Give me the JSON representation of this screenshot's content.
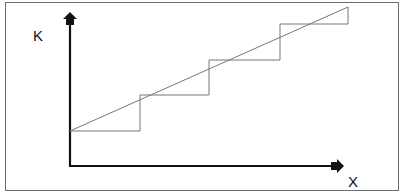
{
  "diagram": {
    "y_axis_label": "K",
    "x_axis_label": "X",
    "colors": {
      "axis": "#111111",
      "line": "#777777",
      "frame": "#6e6e6e"
    },
    "steps": [
      {
        "x_start": 70,
        "x_end": 140,
        "level_y": 131,
        "diag_end_y": 109
      },
      {
        "x_start": 140,
        "x_end": 209,
        "level_y": 95,
        "diag_end_y": 72
      },
      {
        "x_start": 209,
        "x_end": 280,
        "level_y": 60,
        "diag_end_y": 36
      },
      {
        "x_start": 280,
        "x_end": 348,
        "level_y": 24,
        "diag_end_y": 7
      }
    ]
  }
}
